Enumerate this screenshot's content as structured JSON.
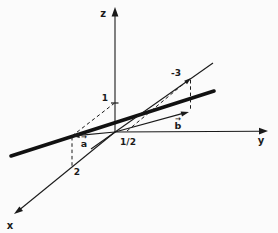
{
  "figure": {
    "background": "#fbfbfb",
    "ink": "#1a1a1a",
    "axis_labels": {
      "x": "x",
      "y": "y",
      "z": "z"
    },
    "value_labels": {
      "z_one": "1",
      "x_two": "2",
      "y_half": "1/2",
      "minus_three": "-3"
    },
    "vector_labels": {
      "a": "a",
      "b": "b",
      "arrow_glyph": "→"
    }
  }
}
